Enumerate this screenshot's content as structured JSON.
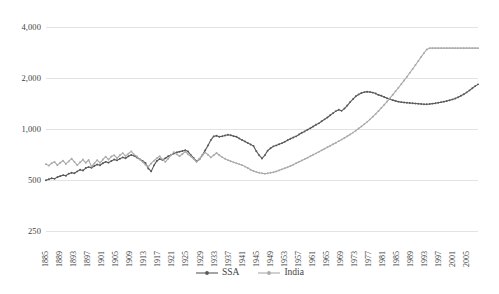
{
  "chart_data": {
    "type": "line",
    "title": "",
    "subtitle": "",
    "xlabel": "",
    "ylabel": "",
    "yscale": "log",
    "ylim": [
      250,
      4000
    ],
    "ytick_labels": [
      "4,000",
      "2,000",
      "1,000",
      "500",
      "250"
    ],
    "ytick_values": [
      4000,
      2000,
      1000,
      500,
      250
    ],
    "grid": true,
    "legend_position": "bottom",
    "x_start": 1885,
    "x_end": 2008,
    "xtick_labels": [
      "1885",
      "1889",
      "1893",
      "1897",
      "1901",
      "1905",
      "1909",
      "1913",
      "1917",
      "1921",
      "1925",
      "1929",
      "1933",
      "1937",
      "1941",
      "1945",
      "1949",
      "1953",
      "1957",
      "1961",
      "1965",
      "1969",
      "1973",
      "1977",
      "1981",
      "1985",
      "1989",
      "1993",
      "1997",
      "2001",
      "2005"
    ],
    "series": [
      {
        "name": "SSA",
        "color": "#595959",
        "marker": "circle",
        "values": [
          498,
          505,
          512,
          508,
          520,
          527,
          534,
          530,
          545,
          552,
          548,
          562,
          575,
          569,
          588,
          596,
          590,
          605,
          617,
          611,
          628,
          640,
          633,
          648,
          660,
          653,
          667,
          680,
          672,
          690,
          703,
          695,
          679,
          663,
          648,
          630,
          585,
          562,
          610,
          648,
          665,
          657,
          672,
          690,
          703,
          716,
          728,
          735,
          742,
          750,
          736,
          700,
          672,
          645,
          663,
          700,
          748,
          800,
          860,
          905,
          912,
          900,
          906,
          916,
          925,
          918,
          908,
          900,
          880,
          862,
          845,
          828,
          810,
          795,
          740,
          700,
          670,
          700,
          745,
          770,
          790,
          800,
          812,
          825,
          840,
          858,
          875,
          890,
          905,
          928,
          950,
          968,
          990,
          1010,
          1035,
          1060,
          1080,
          1110,
          1140,
          1170,
          1205,
          1240,
          1275,
          1300,
          1280,
          1320,
          1375,
          1440,
          1500,
          1560,
          1600,
          1630,
          1650,
          1660,
          1655,
          1640,
          1620,
          1590,
          1570,
          1545,
          1520,
          1500,
          1480,
          1465,
          1450,
          1440,
          1435,
          1430,
          1425,
          1420,
          1415,
          1410,
          1405,
          1400,
          1400,
          1405,
          1412,
          1420,
          1430,
          1440,
          1450,
          1462,
          1478,
          1495,
          1515,
          1540,
          1570,
          1605,
          1645,
          1690,
          1740,
          1790,
          1835
        ]
      },
      {
        "name": "India",
        "color": "#aaaaaa",
        "marker": "circle",
        "values": [
          620,
          608,
          628,
          640,
          612,
          632,
          650,
          622,
          644,
          668,
          640,
          612,
          636,
          660,
          632,
          656,
          600,
          626,
          655,
          632,
          660,
          686,
          660,
          688,
          700,
          672,
          700,
          720,
          694,
          716,
          738,
          706,
          688,
          662,
          640,
          615,
          600,
          626,
          650,
          672,
          690,
          662,
          640,
          668,
          700,
          730,
          710,
          690,
          712,
          735,
          710,
          688,
          665,
          640,
          668,
          700,
          728,
          705,
          680,
          700,
          722,
          700,
          682,
          668,
          655,
          645,
          636,
          628,
          620,
          612,
          600,
          588,
          575,
          565,
          558,
          552,
          548,
          545,
          548,
          552,
          556,
          562,
          570,
          578,
          586,
          595,
          605,
          616,
          628,
          640,
          652,
          664,
          676,
          690,
          704,
          718,
          733,
          748,
          764,
          780,
          796,
          813,
          830,
          848,
          866,
          886,
          906,
          928,
          952,
          978,
          1006,
          1036,
          1068,
          1102,
          1140,
          1182,
          1228,
          1278,
          1332,
          1390,
          1452,
          1520,
          1592,
          1670,
          1752,
          1840,
          1935,
          2035,
          2145,
          2260,
          2385,
          2520,
          2665,
          2810,
          2950,
          3000,
          3000,
          3000,
          3000,
          3000,
          3000,
          3000,
          3000,
          3000,
          3000,
          3000,
          3000,
          3000,
          3000,
          3000,
          3000,
          3000,
          3000
        ]
      }
    ]
  },
  "legend": {
    "items": [
      {
        "label": "SSA",
        "color": "#595959"
      },
      {
        "label": "India",
        "color": "#aaaaaa"
      }
    ]
  }
}
